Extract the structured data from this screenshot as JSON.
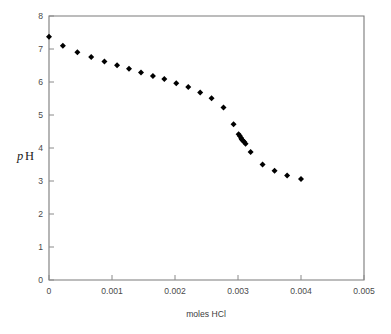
{
  "chart_data": {
    "type": "scatter",
    "title": "",
    "xlabel": "moles HCl",
    "ylabel": "pH",
    "ylabel_parts": {
      "italic": "p",
      "roman": "H"
    },
    "xlim": [
      0,
      0.005
    ],
    "ylim": [
      0,
      8
    ],
    "grid": false,
    "legend": null,
    "marker": "diamond",
    "marker_color": "#000000",
    "frame_color": "#7a7a7a",
    "xticks": [
      0,
      0.001,
      0.002,
      0.003,
      0.004,
      0.005
    ],
    "xticklabels": [
      "0",
      "0.001",
      "0.002",
      "0.003",
      "0.004",
      "0.005"
    ],
    "yticks": [
      0,
      1,
      2,
      3,
      4,
      5,
      6,
      7,
      8
    ],
    "yticklabels": [
      "0",
      "1",
      "2",
      "3",
      "4",
      "5",
      "6",
      "7",
      "8"
    ],
    "x": [
      0.0,
      0.00022,
      0.00045,
      0.00067,
      0.00088,
      0.00108,
      0.00127,
      0.00146,
      0.00165,
      0.00183,
      0.00202,
      0.00221,
      0.0024,
      0.00258,
      0.00277,
      0.00293,
      0.00301,
      0.00303,
      0.00305,
      0.00306,
      0.00308,
      0.0031,
      0.00312,
      0.0032,
      0.00339,
      0.00358,
      0.00378,
      0.004
    ],
    "y": [
      7.37,
      7.1,
      6.9,
      6.76,
      6.62,
      6.51,
      6.4,
      6.29,
      6.18,
      6.09,
      5.96,
      5.85,
      5.68,
      5.51,
      5.23,
      4.72,
      4.42,
      4.36,
      4.3,
      4.26,
      4.22,
      4.18,
      4.13,
      3.88,
      3.5,
      3.31,
      3.17,
      3.06
    ],
    "cluster_note": "dense overlapping points near x=0.00305, pH=4.3"
  },
  "figure": {
    "background": "#ffffff"
  }
}
